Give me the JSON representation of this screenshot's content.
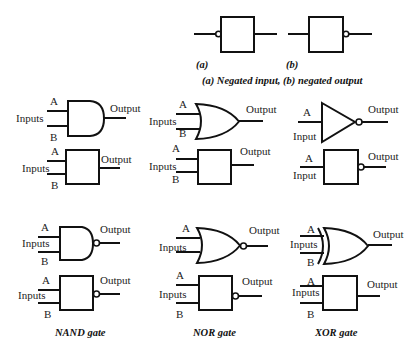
{
  "top": {
    "label_a": "(a)",
    "label_b": "(b)",
    "caption": "(a) Negated input, (b) negated output"
  },
  "labels": {
    "input_a": "A",
    "input_b": "B",
    "inputs": "Inputs",
    "input": "Input",
    "output": "Output"
  },
  "gates": {
    "and": {
      "name": "AND gate"
    },
    "or": {
      "name": "OR gate"
    },
    "not": {
      "name": "NOT gate"
    },
    "nand": {
      "name": "NAND gate"
    },
    "nor": {
      "name": "NOR gate"
    },
    "xor": {
      "name": "XOR gate"
    }
  },
  "captions": {
    "nand": "NAND gate",
    "nor": "NOR gate",
    "xor": "XOR gate"
  }
}
